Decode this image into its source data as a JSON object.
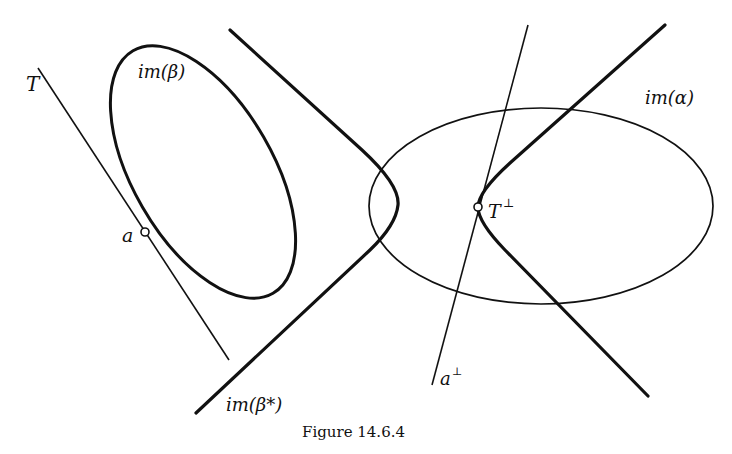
{
  "figure": {
    "caption": "Figure 14.6.4",
    "labels": {
      "T": "T",
      "im_beta": "im(β)",
      "a": "a",
      "im_alpha": "im(α)",
      "T_perp": "T",
      "T_perp_sup": "⊥",
      "a_perp": "a",
      "a_perp_sup": "⊥",
      "im_beta_star": "im(β*)"
    },
    "colors": {
      "stroke": "#111111",
      "background": "#ffffff"
    }
  }
}
